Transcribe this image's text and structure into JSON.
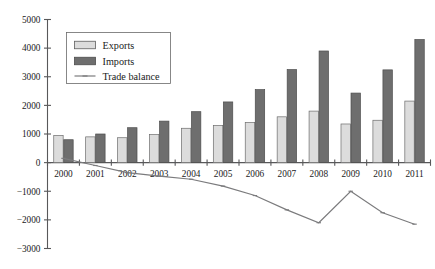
{
  "chart_data": {
    "type": "bar",
    "title": "",
    "subtitle": "",
    "xlabel": "",
    "ylabel": "",
    "categories": [
      "2000",
      "2001",
      "2002",
      "2003",
      "2004",
      "2005",
      "2006",
      "2007",
      "2008",
      "2009",
      "2010",
      "2011"
    ],
    "ylim": [
      -3000,
      5000
    ],
    "ytick_labels": [
      "5000",
      "4000",
      "3000",
      "2000",
      "1000",
      "0",
      "−1000",
      "−2000",
      "−3000"
    ],
    "ytick_values": [
      5000,
      4000,
      3000,
      2000,
      1000,
      0,
      -1000,
      -2000,
      -3000
    ],
    "grid": false,
    "legend_position": "top-left",
    "series": [
      {
        "name": "Exports",
        "type": "bar",
        "color": "#dcdcdc",
        "values": [
          950,
          900,
          870,
          980,
          1200,
          1300,
          1400,
          1600,
          1800,
          1350,
          1480,
          2150
        ]
      },
      {
        "name": "Imports",
        "type": "bar",
        "color": "#6e6e6e",
        "values": [
          800,
          1000,
          1220,
          1450,
          1780,
          2120,
          2550,
          3250,
          3900,
          2430,
          3240,
          4300
        ]
      },
      {
        "name": "Trade balance",
        "type": "line",
        "color": "#7b7b7d",
        "values": [
          150,
          -100,
          -350,
          -470,
          -580,
          -820,
          -1150,
          -1650,
          -2100,
          -1000,
          -1750,
          -2150
        ]
      }
    ]
  },
  "legend": {
    "items": [
      {
        "label": "Exports",
        "marker": "filled-square-light"
      },
      {
        "label": "Imports",
        "marker": "filled-square-dark"
      },
      {
        "label": "Trade balance",
        "marker": "line-with-point"
      }
    ]
  }
}
